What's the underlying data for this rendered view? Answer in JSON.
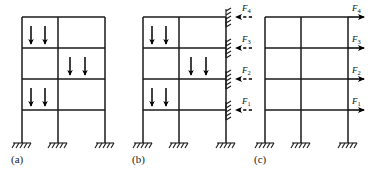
{
  "figure": {
    "background_color": "#ffffff",
    "line_color": "#1a1a1a",
    "arrow_color": "#000000",
    "canvas": {
      "width": 370,
      "height": 179
    }
  },
  "panels": [
    {
      "id": "a",
      "caption": "(a)",
      "caption_pos": {
        "x": 11,
        "y": 155
      },
      "description": "Two-bay four-storey frame with gravity point loads, no lateral restraint",
      "frame": {
        "x_columns": [
          22,
          58,
          105
        ],
        "y_floors": [
          17,
          48,
          79,
          110
        ],
        "y_base": 143
      },
      "gravity_loads": [
        {
          "bay": "left",
          "floor": 1,
          "x": 31,
          "y_tip": 48,
          "y_tail": 26
        },
        {
          "bay": "left",
          "floor": 1,
          "x": 45,
          "y_tip": 48,
          "y_tail": 26
        },
        {
          "bay": "right",
          "floor": 2,
          "x": 70,
          "y_tip": 79,
          "y_tail": 57
        },
        {
          "bay": "right",
          "floor": 2,
          "x": 85,
          "y_tip": 79,
          "y_tail": 57
        },
        {
          "bay": "left",
          "floor": 3,
          "x": 31,
          "y_tip": 110,
          "y_tail": 88
        },
        {
          "bay": "left",
          "floor": 3,
          "x": 45,
          "y_tip": 110,
          "y_tail": 88
        }
      ],
      "base_supports": [
        {
          "x": 22,
          "y": 143
        },
        {
          "x": 58,
          "y": 143
        },
        {
          "x": 105,
          "y": 143
        }
      ]
    },
    {
      "id": "b",
      "caption": "(b)",
      "caption_pos": {
        "x": 132,
        "y": 155
      },
      "description": "Same frame with horizontal roller restraints at each floor; restraint reactions F1 to F4 shown as dashed leftward arrows",
      "frame": {
        "x_columns": [
          143,
          179,
          226
        ],
        "y_floors": [
          17,
          48,
          79,
          110
        ],
        "y_base": 143
      },
      "gravity_loads": [
        {
          "bay": "left",
          "floor": 1,
          "x": 152,
          "y_tip": 48,
          "y_tail": 26
        },
        {
          "bay": "left",
          "floor": 1,
          "x": 166,
          "y_tip": 48,
          "y_tail": 26
        },
        {
          "bay": "right",
          "floor": 2,
          "x": 191,
          "y_tip": 79,
          "y_tail": 57
        },
        {
          "bay": "right",
          "floor": 2,
          "x": 206,
          "y_tip": 79,
          "y_tail": 57
        },
        {
          "bay": "left",
          "floor": 3,
          "x": 152,
          "y_tip": 110,
          "y_tail": 88
        },
        {
          "bay": "left",
          "floor": 3,
          "x": 166,
          "y_tip": 110,
          "y_tail": 88
        }
      ],
      "restraints": [
        {
          "label": "F",
          "sub": "4",
          "y": 17,
          "label_x": 244,
          "label_y": 5
        },
        {
          "label": "F",
          "sub": "3",
          "y": 48,
          "label_x": 244,
          "label_y": 36
        },
        {
          "label": "F",
          "sub": "2",
          "y": 79,
          "label_x": 244,
          "label_y": 67
        },
        {
          "label": "F",
          "sub": "1",
          "y": 110,
          "label_x": 244,
          "label_y": 98
        }
      ],
      "reaction_direction": "left",
      "reaction_style": "dashed",
      "base_supports": [
        {
          "x": 143,
          "y": 143
        },
        {
          "x": 179,
          "y": 143
        },
        {
          "x": 226,
          "y": 143
        }
      ]
    },
    {
      "id": "c",
      "caption": "(c)",
      "caption_pos": {
        "x": 254,
        "y": 155
      },
      "description": "Bare frame loaded by the reversed restraint reactions F1 to F4 applied as lateral loads to the right",
      "frame": {
        "x_columns": [
          265,
          301,
          348
        ],
        "y_floors": [
          17,
          48,
          79,
          110
        ],
        "y_base": 143
      },
      "gravity_loads": [],
      "lateral_loads": [
        {
          "label": "F",
          "sub": "4",
          "y": 17,
          "x_tail": 348,
          "x_tip": 366,
          "label_x": 352,
          "label_y": 5
        },
        {
          "label": "F",
          "sub": "3",
          "y": 48,
          "x_tail": 348,
          "x_tip": 366,
          "label_x": 352,
          "label_y": 36
        },
        {
          "label": "F",
          "sub": "2",
          "y": 79,
          "x_tail": 348,
          "x_tip": 366,
          "label_x": 352,
          "label_y": 67
        },
        {
          "label": "F",
          "sub": "1",
          "y": 110,
          "x_tail": 348,
          "x_tip": 366,
          "label_x": 352,
          "label_y": 98
        }
      ],
      "load_direction": "right",
      "load_style": "solid",
      "base_supports": [
        {
          "x": 265,
          "y": 143
        },
        {
          "x": 301,
          "y": 143
        },
        {
          "x": 348,
          "y": 143
        }
      ]
    }
  ],
  "force_labels": {
    "f1": "F",
    "f1_sub": "1",
    "f2": "F",
    "f2_sub": "2",
    "f3": "F",
    "f3_sub": "3",
    "f4": "F",
    "f4_sub": "4"
  },
  "captions": {
    "a": "(a)",
    "b": "(b)",
    "c": "(c)"
  }
}
